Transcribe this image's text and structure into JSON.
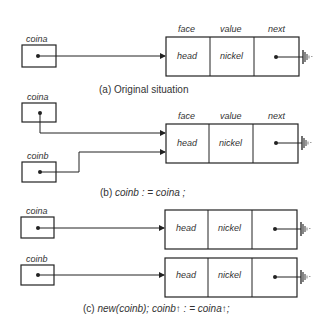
{
  "panels": {
    "a": {
      "caption": "(a) Original situation",
      "pointers": [
        {
          "name": "coina"
        }
      ],
      "record": {
        "fields": [
          "face",
          "value",
          "next"
        ],
        "values": [
          "head",
          "nickel",
          ""
        ]
      }
    },
    "b": {
      "caption_prefix": "(b) ",
      "caption_code": "coinb : = coina ;",
      "pointers": [
        {
          "name": "coina"
        },
        {
          "name": "coinb"
        }
      ],
      "record": {
        "fields": [
          "face",
          "value",
          "next"
        ],
        "values": [
          "head",
          "nickel",
          ""
        ]
      }
    },
    "c": {
      "caption_prefix": "(c) ",
      "caption_code": "new(coinb); coinb↑ : = coina↑;",
      "pointers": [
        {
          "name": "coina"
        },
        {
          "name": "coinb"
        }
      ],
      "records": [
        {
          "values": [
            "head",
            "nickel",
            ""
          ]
        },
        {
          "values": [
            "head",
            "nickel",
            ""
          ]
        }
      ]
    }
  }
}
